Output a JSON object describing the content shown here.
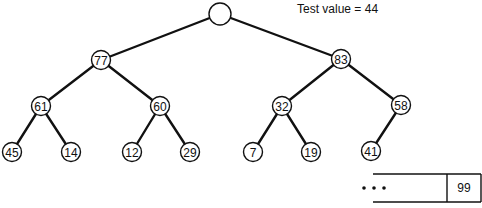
{
  "caption": {
    "label": "Test value",
    "operator": "=",
    "value": "44",
    "text": "Test value = 44"
  },
  "tree": {
    "nodes": [
      {
        "id": "root",
        "label": "",
        "x": 220,
        "y": 14
      },
      {
        "id": "n77",
        "label": "77",
        "x": 101,
        "y": 60
      },
      {
        "id": "n83",
        "label": "83",
        "x": 341,
        "y": 59
      },
      {
        "id": "n61",
        "label": "61",
        "x": 41,
        "y": 106
      },
      {
        "id": "n60",
        "label": "60",
        "x": 160,
        "y": 106
      },
      {
        "id": "n32",
        "label": "32",
        "x": 282,
        "y": 106
      },
      {
        "id": "n58",
        "label": "58",
        "x": 401,
        "y": 105
      },
      {
        "id": "n45",
        "label": "45",
        "x": 12,
        "y": 152
      },
      {
        "id": "n14",
        "label": "14",
        "x": 71,
        "y": 152
      },
      {
        "id": "n12",
        "label": "12",
        "x": 132,
        "y": 152
      },
      {
        "id": "n29",
        "label": "29",
        "x": 190,
        "y": 152
      },
      {
        "id": "n7",
        "label": "7",
        "x": 253,
        "y": 152
      },
      {
        "id": "n19",
        "label": "19",
        "x": 311,
        "y": 152
      },
      {
        "id": "n41",
        "label": "41",
        "x": 371,
        "y": 151
      }
    ],
    "edges": [
      [
        "root",
        "n77"
      ],
      [
        "root",
        "n83"
      ],
      [
        "n77",
        "n61"
      ],
      [
        "n77",
        "n60"
      ],
      [
        "n83",
        "n32"
      ],
      [
        "n83",
        "n58"
      ],
      [
        "n61",
        "n45"
      ],
      [
        "n61",
        "n14"
      ],
      [
        "n60",
        "n12"
      ],
      [
        "n60",
        "n29"
      ],
      [
        "n32",
        "n7"
      ],
      [
        "n32",
        "n19"
      ],
      [
        "n58",
        "n41"
      ]
    ]
  },
  "array": {
    "ellipsis": "• • •",
    "last_cell": "99"
  }
}
